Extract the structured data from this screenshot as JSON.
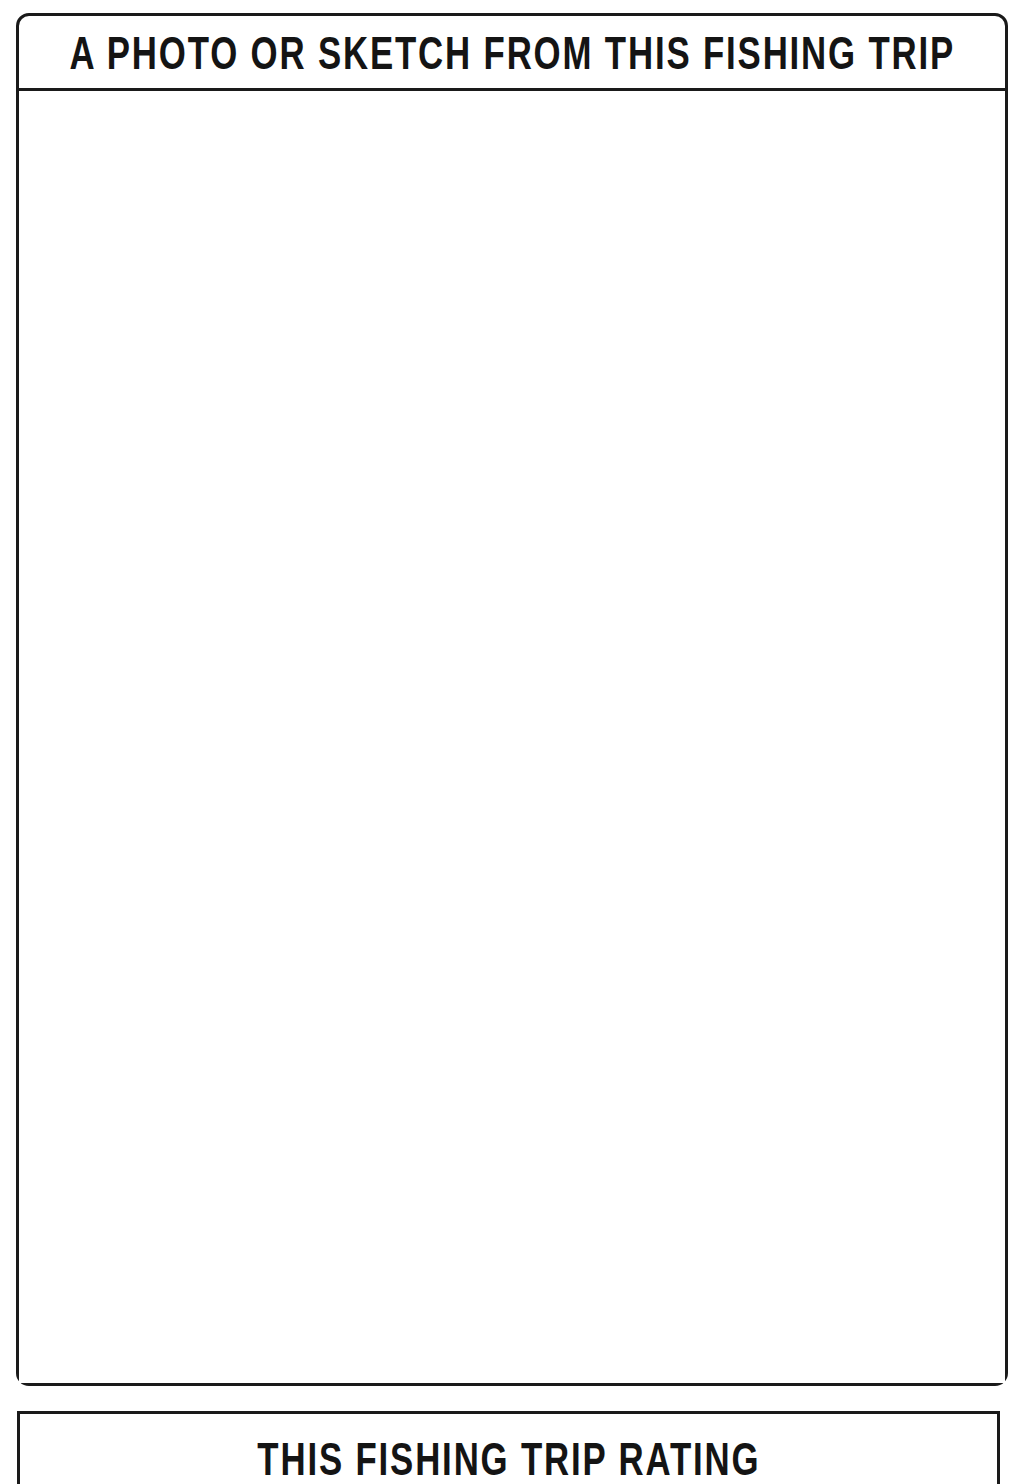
{
  "page": {
    "kind": "fishing-log-journal-page",
    "background_color": "#ffffff",
    "ink_color": "#141414"
  },
  "photo_panel": {
    "title": "A PHOTO OR SKETCH FROM THIS FISHING TRIP",
    "body_content": "",
    "body_placeholder": ""
  },
  "rating_panel": {
    "title": "THIS FISHING TRIP RATING"
  }
}
